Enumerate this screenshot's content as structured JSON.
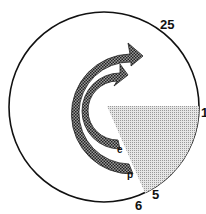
{
  "diagram": {
    "type": "cycle",
    "labels": {
      "top_right": "25",
      "right": "1",
      "bottom_right": "5",
      "bottom": "6",
      "inner_arrow_end": "e",
      "outer_arrow_end": "p"
    },
    "colors": {
      "outline": "#111111",
      "arrow_fill": "#555555",
      "sector_fill": "#bbbbbb",
      "background": "#ffffff"
    }
  }
}
